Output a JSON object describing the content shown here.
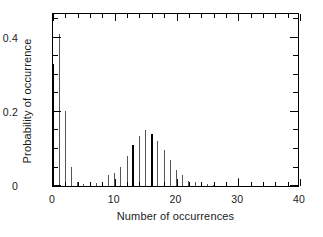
{
  "chart_data": {
    "type": "bar",
    "title": "",
    "subtitle": "",
    "xlabel": "Number of occurrences",
    "ylabel": "Probability of occurrence",
    "xlim": [
      0,
      40
    ],
    "ylim": [
      0,
      0.47
    ],
    "xticks": [
      0,
      10,
      20,
      30,
      40
    ],
    "xtick_labels": [
      "0",
      "10",
      "20",
      "30",
      "40"
    ],
    "xticks_minor_step": 2,
    "yticks": [
      0,
      0.2,
      0.4
    ],
    "ytick_labels": [
      "0",
      "0.2",
      "0.4"
    ],
    "grid": false,
    "legend": "none",
    "style": "vertical impulse / stem plot, two overlaid series",
    "series": [
      {
        "name": "thin-stems",
        "color": "#555555",
        "linewidth": "thin",
        "x": [
          1,
          2,
          3,
          4,
          5,
          6,
          7,
          8,
          9,
          10,
          11,
          12,
          14,
          15,
          17,
          18,
          19,
          20,
          21,
          22,
          23,
          24,
          25,
          26,
          30
        ],
        "values": [
          0.41,
          0.202,
          0.052,
          0.012,
          0.006,
          0.004,
          0.009,
          0.008,
          0.031,
          0.034,
          0.052,
          0.082,
          0.135,
          0.15,
          0.122,
          0.098,
          0.07,
          0.044,
          0.03,
          0.014,
          0.01,
          0.006,
          0.005,
          0.004,
          0.021
        ]
      },
      {
        "name": "bold-stems",
        "color": "#000000",
        "linewidth": "bold",
        "x": [
          0,
          13,
          16
        ],
        "values": [
          0.33,
          0.112,
          0.14
        ]
      }
    ]
  },
  "axes": {
    "x_title": "Number of occurrences",
    "y_title": "Probability of occurrence",
    "x_tick_labels": [
      "0",
      "10",
      "20",
      "30",
      "40"
    ],
    "y_tick_labels": [
      "0",
      "0.2",
      "0.4"
    ]
  },
  "figure": {
    "background_color": "#ffffff",
    "frame_color": "#000000",
    "thin_series_color": "#555555",
    "bold_series_color": "#000000"
  }
}
